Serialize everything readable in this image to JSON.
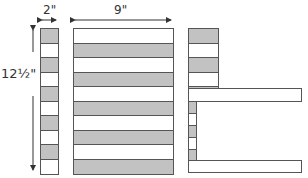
{
  "labels": {
    "width_small": "2\"",
    "width_large": "9\"",
    "height": "12½\""
  },
  "colors": {
    "gray_fill": "#c2c2c2",
    "white_fill": "#ffffff",
    "stroke": "#555555"
  },
  "left_column": {
    "pattern": [
      "gray",
      "white",
      "gray",
      "white",
      "gray",
      "white",
      "gray",
      "white",
      "gray",
      "white"
    ]
  },
  "main_block": {
    "pattern": [
      "white",
      "gray",
      "white",
      "gray",
      "white",
      "gray",
      "white",
      "gray",
      "white",
      "gray"
    ]
  },
  "right_shape": {
    "top_cells": [
      "gray",
      "white",
      "gray",
      "white",
      "gray"
    ],
    "middle_long_strip": "white",
    "narrow_cells": [
      "gray",
      "white",
      "gray",
      "white",
      "gray"
    ],
    "bottom_long_strip": "white"
  }
}
